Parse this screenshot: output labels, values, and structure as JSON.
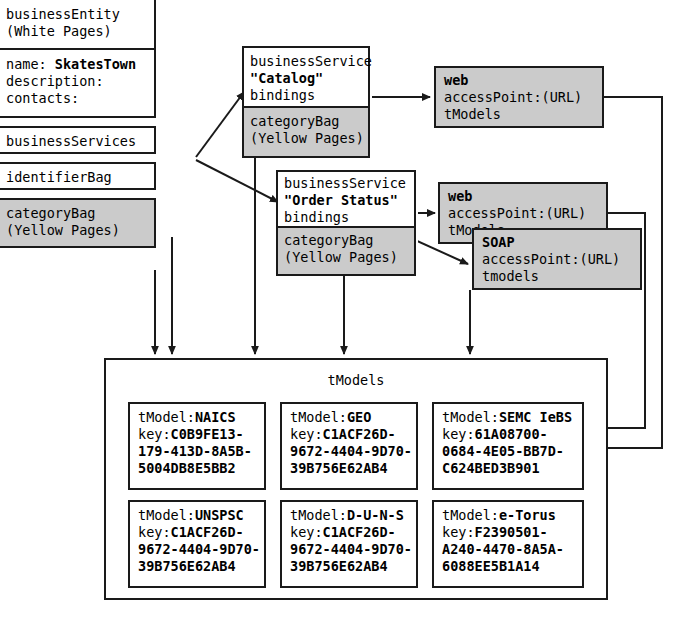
{
  "diagram": {
    "colors": {
      "gray_fill": "#cbcbcb",
      "stroke": "#1a1a1a",
      "background": "#ffffff"
    }
  },
  "business_entity": {
    "header": {
      "line1": "businessEntity",
      "line2": "(White Pages)"
    },
    "details": {
      "name_label": "name: ",
      "name_value": "SkatesTown",
      "description_label": "description:",
      "contacts_label": "contacts:"
    },
    "business_services_label": "businessServices",
    "identifier_bag_label": "identifierBag",
    "category_bag": {
      "line1": "categoryBag",
      "line2": "(Yellow Pages)"
    }
  },
  "services": [
    {
      "type_label": "businessService",
      "name": "\"Catalog\"",
      "bindings_label": "bindings",
      "category_bag": {
        "line1": "categoryBag",
        "line2": "(Yellow Pages)"
      }
    },
    {
      "type_label": "businessService",
      "name": "\"Order Status\"",
      "bindings_label": "bindings",
      "category_bag": {
        "line1": "categoryBag",
        "line2": "(Yellow Pages)"
      }
    }
  ],
  "bindings": [
    {
      "protocol": "web",
      "access_point": "accessPoint:(URL)",
      "tmodels_label": "tModels"
    },
    {
      "protocol": "web",
      "access_point": "accessPoint:(URL)",
      "tmodels_label": "tModels"
    },
    {
      "protocol": "SOAP",
      "access_point": "accessPoint:(URL)",
      "tmodels_label": "tmodels"
    }
  ],
  "tmodels": {
    "title": "tModels",
    "cells": [
      {
        "name_label": "tModel:",
        "name_value": "NAICS",
        "key_label": "key:",
        "key_lines": [
          "C0B9FE13-",
          "179-413D-8A5B-",
          "5004DB8E5BB2"
        ]
      },
      {
        "name_label": "tModel:",
        "name_value": "GEO",
        "key_label": "key:",
        "key_lines": [
          "C1ACF26D-",
          "9672-4404-9D70-",
          "39B756E62AB4"
        ]
      },
      {
        "name_label": "tModel:",
        "name_value": "SEMC IeBS",
        "key_label": "key:",
        "key_lines": [
          "61A08700-",
          "0684-4E05-BB7D-",
          "C624BED3B901"
        ]
      },
      {
        "name_label": "tModel:",
        "name_value": "UNSPSC",
        "key_label": "key:",
        "key_lines": [
          "C1ACF26D-",
          "9672-4404-9D70-",
          "39B756E62AB4"
        ]
      },
      {
        "name_label": "tModel:",
        "name_value": "D-U-N-S",
        "key_label": "key:",
        "key_lines": [
          "C1ACF26D-",
          "9672-4404-9D70-",
          "39B756E62AB4"
        ]
      },
      {
        "name_label": "tModel:",
        "name_value": "e-Torus",
        "key_label": "key:",
        "key_lines": [
          "F2390501-",
          "A240-4470-8A5A-",
          "6088EE5B1A14"
        ]
      }
    ]
  }
}
